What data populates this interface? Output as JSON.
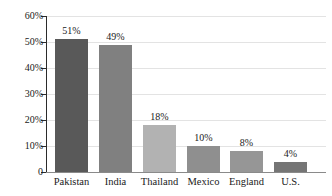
{
  "chart_data": {
    "type": "bar",
    "title": "",
    "subtitle": "",
    "xlabel": "",
    "ylabel": "",
    "categories": [
      "Pakistan",
      "India",
      "Thailand",
      "Mexico",
      "England",
      "U.S."
    ],
    "values": [
      51,
      49,
      18,
      10,
      8,
      4
    ],
    "value_labels": [
      "51%",
      "49%",
      "18%",
      "10%",
      "8%",
      "4%"
    ],
    "bar_colors": [
      "#595959",
      "#808080",
      "#b2b2b2",
      "#8f8f8f",
      "#969696",
      "#757575"
    ],
    "ylim": [
      0,
      60
    ],
    "ytick_values": [
      60,
      50,
      40,
      30,
      20,
      10,
      0
    ],
    "ytick_labels": [
      "60%",
      "50%",
      "40%",
      "30%",
      "20%",
      "10%",
      "0"
    ],
    "grid": true,
    "grid_axis": "y",
    "grid_color": "#e3e3e3",
    "legend": false,
    "legend_position": "none",
    "axis_color": "#2b2b2b",
    "baseline_color": "#8a8a8a",
    "background_color": "#ffffff",
    "annotations": []
  }
}
